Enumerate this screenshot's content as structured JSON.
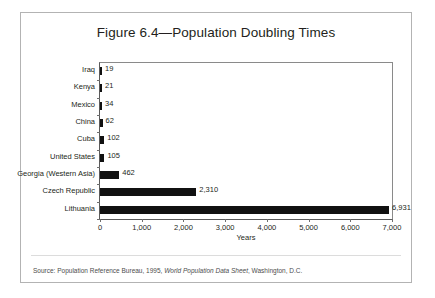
{
  "figure": {
    "title": "Figure 6.4—Population Doubling Times",
    "source_prefix": "Source: Population Reference Bureau, 1995, ",
    "source_italic": "World Population Data Sheet",
    "source_suffix": ", Washington, D.C."
  },
  "chart_data": {
    "type": "bar",
    "orientation": "horizontal",
    "title": "Figure 6.4—Population Doubling Times",
    "xlabel": "Years",
    "ylabel": "",
    "xlim": [
      0,
      7000
    ],
    "xticks": [
      0,
      1000,
      2000,
      3000,
      4000,
      5000,
      6000,
      7000
    ],
    "xticklabels": [
      "0",
      "1,000",
      "2,000",
      "3,000",
      "4,000",
      "5,000",
      "6,000",
      "7,000"
    ],
    "grid": false,
    "legend": false,
    "bar_color": "#111111",
    "categories": [
      "Iraq",
      "Kenya",
      "Mexico",
      "China",
      "Cuba",
      "United States",
      "Georgia (Western Asia)",
      "Czech Republic",
      "Lithuania"
    ],
    "values": [
      19,
      21,
      34,
      62,
      102,
      105,
      462,
      2310,
      6931
    ],
    "value_labels": [
      "19",
      "21",
      "34",
      "62",
      "102",
      "105",
      "462",
      "2,310",
      "6,931"
    ]
  }
}
